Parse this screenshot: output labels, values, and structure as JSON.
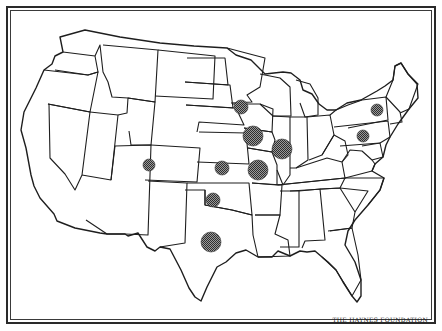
{
  "map": {
    "title": "",
    "region": "Contiguous United States",
    "credit": "THE HAYNES FOUNDATION",
    "marker_pattern": "stippled-dot-circle",
    "colors": {
      "stroke": "#1e1e1e",
      "marker_fill": "#6a6a6a",
      "background": "#ffffff"
    },
    "markers": [
      {
        "state": "Minnesota",
        "cx": 241,
        "cy": 107,
        "r": 7
      },
      {
        "state": "Iowa",
        "cx": 253,
        "cy": 136,
        "r": 10
      },
      {
        "state": "Illinois",
        "cx": 282,
        "cy": 149,
        "r": 10
      },
      {
        "state": "Missouri",
        "cx": 258,
        "cy": 170,
        "r": 10
      },
      {
        "state": "Kansas",
        "cx": 222,
        "cy": 168,
        "r": 7
      },
      {
        "state": "Colorado",
        "cx": 149,
        "cy": 165,
        "r": 6
      },
      {
        "state": "Oklahoma",
        "cx": 213,
        "cy": 200,
        "r": 7
      },
      {
        "state": "Texas",
        "cx": 211,
        "cy": 242,
        "r": 10
      },
      {
        "state": "New York",
        "cx": 377,
        "cy": 110,
        "r": 6
      },
      {
        "state": "Pennsylvania",
        "cx": 363,
        "cy": 136,
        "r": 6
      }
    ]
  }
}
